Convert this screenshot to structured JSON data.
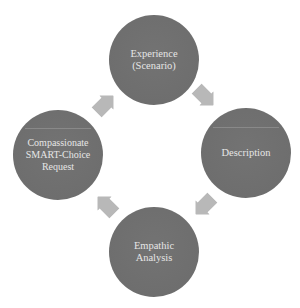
{
  "diagram": {
    "type": "cycle",
    "top_cut_text": "…p    p    gg g  p…",
    "colors": {
      "node_fill": "#6f6f6f",
      "node_text": "#e6e6e6",
      "arrow_fill": "#b8b8b8",
      "background": "#ffffff"
    },
    "nodes": [
      {
        "id": "experience",
        "label": "Experience\n(Scenario)"
      },
      {
        "id": "description",
        "label": "Description"
      },
      {
        "id": "empathic-analysis",
        "label": "Empathic\nAnalysis"
      },
      {
        "id": "compassionate-request",
        "label": "Compassionate\nSMART-Choice\nRequest"
      }
    ],
    "edges": [
      {
        "from": "experience",
        "to": "description"
      },
      {
        "from": "description",
        "to": "empathic-analysis"
      },
      {
        "from": "empathic-analysis",
        "to": "compassionate-request"
      },
      {
        "from": "compassionate-request",
        "to": "experience"
      }
    ]
  }
}
